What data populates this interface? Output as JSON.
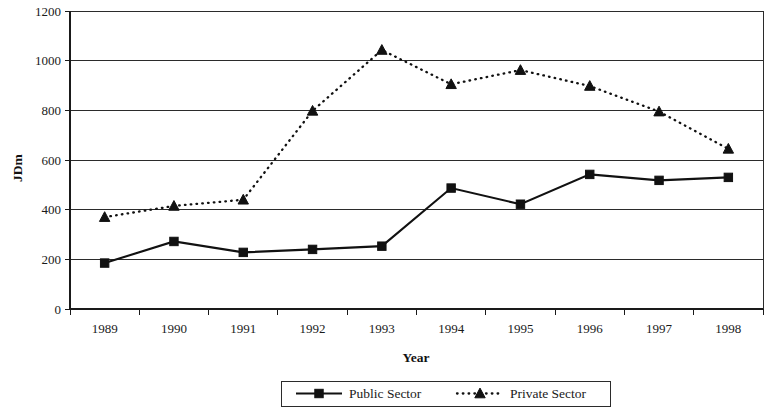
{
  "chart_data": {
    "type": "line",
    "title": "",
    "xlabel": "Year",
    "ylabel": "JDm",
    "categories": [
      "1989",
      "1990",
      "1991",
      "1992",
      "1993",
      "1994",
      "1995",
      "1996",
      "1997",
      "1998"
    ],
    "x": [
      1989,
      1990,
      1991,
      1992,
      1993,
      1994,
      1995,
      1996,
      1997,
      1998
    ],
    "ylim": [
      0,
      1200
    ],
    "ytick_labels": [
      "0",
      "200",
      "400",
      "600",
      "800",
      "1000",
      "1200"
    ],
    "yticks": [
      0,
      200,
      400,
      600,
      800,
      1000,
      1200
    ],
    "grid": true,
    "legend_position": "bottom",
    "series": [
      {
        "name": "Public Sector",
        "marker": "square",
        "line_style": "solid",
        "color": "#111111",
        "values": [
          185,
          272,
          228,
          240,
          253,
          487,
          422,
          542,
          518,
          530
        ]
      },
      {
        "name": "Private Sector",
        "marker": "triangle",
        "line_style": "dotted",
        "color": "#111111",
        "values": [
          370,
          415,
          440,
          798,
          1043,
          905,
          962,
          898,
          795,
          645
        ]
      }
    ]
  },
  "axes": {
    "y_axis_title": "JDm",
    "x_axis_title": "Year"
  },
  "legend": {
    "entries": [
      {
        "label": "Public Sector",
        "marker": "square-marker-icon",
        "line": "solid-line-icon"
      },
      {
        "label": "Private Sector",
        "marker": "triangle-marker-icon",
        "line": "dotted-line-icon"
      }
    ]
  }
}
